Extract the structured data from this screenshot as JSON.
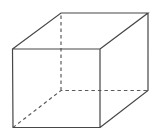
{
  "figure": {
    "background_color": "#ffffff",
    "stroke_color": "#474747",
    "hidden_stroke_color": "#5a5a5a",
    "dash_pattern": "3.5 3",
    "vertices": {
      "front_top_left": [
        12.5,
        49
      ],
      "front_top_right": [
        100,
        49
      ],
      "front_bottom_right": [
        100,
        127.5
      ],
      "front_bottom_left": [
        13,
        127.5
      ],
      "back_top_left": [
        61,
        13
      ],
      "back_top_right": [
        148,
        13
      ],
      "back_bottom_right": [
        148,
        90.5
      ],
      "back_bottom_left": [
        61,
        90.5
      ]
    },
    "solid_edges_path": "M12.5,49 L100,49 L100,127.5 L13,127.5 Z M12.5,49 L61,13 L148,13 L100,49 M148,13 L148,90.5 L100,127.5",
    "hidden_edges_path": "M13,127.5 L61,90.5 L148,90.5 M61,90.5 L61,13",
    "viewbox": "0 0 157 139"
  }
}
